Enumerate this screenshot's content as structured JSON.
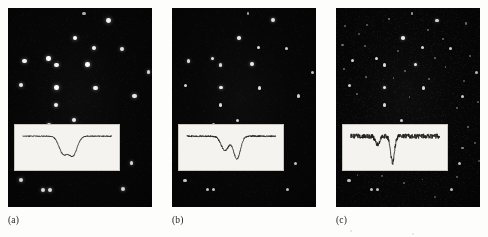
{
  "figure": {
    "background_color": "#fdfdfc",
    "panel_background_color": "#050505",
    "star_color": "#ffffff",
    "inset_background_color": "#f4f3ef",
    "inset_trace_color": "#1a1a1a",
    "caption_color": "#1b1b1b"
  },
  "panels": [
    {
      "id": "panel-a",
      "caption": "(a)",
      "field": {
        "x": 8,
        "y": 8,
        "width": 144,
        "height": 199
      },
      "caption_pos": {
        "x": 8,
        "y": 216
      },
      "depth_note": "bright star field, shallow limiting magnitude",
      "star_count": 22,
      "stars": [
        {
          "x": 0.7,
          "y": 0.062,
          "r": 2.4,
          "b": 1.0
        },
        {
          "x": 0.465,
          "y": 0.15,
          "r": 2.3,
          "b": 1.0
        },
        {
          "x": 0.6,
          "y": 0.2,
          "r": 2.0,
          "b": 0.95
        },
        {
          "x": 0.795,
          "y": 0.205,
          "r": 2.0,
          "b": 0.92
        },
        {
          "x": 0.115,
          "y": 0.265,
          "r": 2.2,
          "b": 0.98
        },
        {
          "x": 0.282,
          "y": 0.253,
          "r": 2.2,
          "b": 0.98
        },
        {
          "x": 0.336,
          "y": 0.287,
          "r": 2.2,
          "b": 0.96
        },
        {
          "x": 0.553,
          "y": 0.283,
          "r": 2.3,
          "b": 1.0
        },
        {
          "x": 0.975,
          "y": 0.323,
          "r": 1.9,
          "b": 0.9
        },
        {
          "x": 0.093,
          "y": 0.388,
          "r": 2.1,
          "b": 0.95
        },
        {
          "x": 0.338,
          "y": 0.4,
          "r": 2.3,
          "b": 1.0
        },
        {
          "x": 0.608,
          "y": 0.402,
          "r": 2.1,
          "b": 0.95
        },
        {
          "x": 0.878,
          "y": 0.443,
          "r": 2.1,
          "b": 0.94
        },
        {
          "x": 0.335,
          "y": 0.487,
          "r": 2.1,
          "b": 0.95
        },
        {
          "x": 0.455,
          "y": 0.565,
          "r": 2.0,
          "b": 0.92
        },
        {
          "x": 0.288,
          "y": 0.588,
          "r": 2.0,
          "b": 0.92
        },
        {
          "x": 0.858,
          "y": 0.78,
          "r": 1.9,
          "b": 0.9
        },
        {
          "x": 0.09,
          "y": 0.866,
          "r": 2.1,
          "b": 0.95
        },
        {
          "x": 0.245,
          "y": 0.913,
          "r": 2.0,
          "b": 0.93
        },
        {
          "x": 0.29,
          "y": 0.913,
          "r": 2.0,
          "b": 0.93
        },
        {
          "x": 0.8,
          "y": 0.912,
          "r": 2.0,
          "b": 0.93
        },
        {
          "x": 0.528,
          "y": 0.028,
          "r": 1.6,
          "b": 0.7
        }
      ],
      "inset": {
        "x": 0.045,
        "y": 0.585,
        "width": 0.735,
        "height": 0.235,
        "baseline_level": 0.25,
        "noise_amplitude": 0.012,
        "dips": [
          {
            "center": 0.455,
            "depth": 0.62,
            "width": 0.055
          },
          {
            "center": 0.565,
            "depth": 0.68,
            "width": 0.055
          }
        ]
      }
    },
    {
      "id": "panel-b",
      "caption": "(b)",
      "field": {
        "x": 172,
        "y": 8,
        "width": 144,
        "height": 199
      },
      "caption_pos": {
        "x": 172,
        "y": 216
      },
      "depth_note": "same field, intermediate depth",
      "star_count": 22,
      "stars": [
        {
          "x": 0.7,
          "y": 0.062,
          "r": 1.9,
          "b": 0.92
        },
        {
          "x": 0.465,
          "y": 0.15,
          "r": 1.8,
          "b": 0.9
        },
        {
          "x": 0.6,
          "y": 0.2,
          "r": 1.7,
          "b": 0.86
        },
        {
          "x": 0.795,
          "y": 0.205,
          "r": 1.7,
          "b": 0.84
        },
        {
          "x": 0.115,
          "y": 0.265,
          "r": 1.8,
          "b": 0.88
        },
        {
          "x": 0.282,
          "y": 0.253,
          "r": 1.8,
          "b": 0.88
        },
        {
          "x": 0.336,
          "y": 0.287,
          "r": 1.8,
          "b": 0.86
        },
        {
          "x": 0.553,
          "y": 0.283,
          "r": 1.9,
          "b": 0.92
        },
        {
          "x": 0.975,
          "y": 0.323,
          "r": 1.6,
          "b": 0.82
        },
        {
          "x": 0.093,
          "y": 0.388,
          "r": 1.7,
          "b": 0.86
        },
        {
          "x": 0.338,
          "y": 0.4,
          "r": 1.9,
          "b": 0.92
        },
        {
          "x": 0.608,
          "y": 0.402,
          "r": 1.7,
          "b": 0.86
        },
        {
          "x": 0.878,
          "y": 0.443,
          "r": 1.7,
          "b": 0.84
        },
        {
          "x": 0.335,
          "y": 0.487,
          "r": 1.7,
          "b": 0.86
        },
        {
          "x": 0.455,
          "y": 0.565,
          "r": 1.6,
          "b": 0.82
        },
        {
          "x": 0.288,
          "y": 0.588,
          "r": 1.6,
          "b": 0.82
        },
        {
          "x": 0.858,
          "y": 0.78,
          "r": 1.6,
          "b": 0.82
        },
        {
          "x": 0.09,
          "y": 0.866,
          "r": 1.7,
          "b": 0.86
        },
        {
          "x": 0.245,
          "y": 0.913,
          "r": 1.7,
          "b": 0.84
        },
        {
          "x": 0.29,
          "y": 0.913,
          "r": 1.7,
          "b": 0.84
        },
        {
          "x": 0.8,
          "y": 0.912,
          "r": 1.7,
          "b": 0.84
        },
        {
          "x": 0.528,
          "y": 0.028,
          "r": 1.4,
          "b": 0.64
        }
      ],
      "inset": {
        "x": 0.045,
        "y": 0.585,
        "width": 0.735,
        "height": 0.235,
        "baseline_level": 0.25,
        "noise_amplitude": 0.018,
        "dips": [
          {
            "center": 0.43,
            "depth": 0.52,
            "width": 0.05
          },
          {
            "center": 0.565,
            "depth": 0.82,
            "width": 0.045
          }
        ]
      }
    },
    {
      "id": "panel-c",
      "caption": "(c)",
      "field": {
        "x": 336,
        "y": 8,
        "width": 144,
        "height": 199
      },
      "caption_pos": {
        "x": 336,
        "y": 216
      },
      "depth_note": "deepest exposure, many faint stars visible",
      "star_count": 56,
      "stars": [
        {
          "x": 0.7,
          "y": 0.062,
          "r": 1.8,
          "b": 0.88
        },
        {
          "x": 0.465,
          "y": 0.15,
          "r": 1.8,
          "b": 0.9
        },
        {
          "x": 0.6,
          "y": 0.2,
          "r": 1.6,
          "b": 0.84
        },
        {
          "x": 0.795,
          "y": 0.205,
          "r": 1.6,
          "b": 0.82
        },
        {
          "x": 0.115,
          "y": 0.265,
          "r": 1.7,
          "b": 0.86
        },
        {
          "x": 0.282,
          "y": 0.253,
          "r": 1.7,
          "b": 0.86
        },
        {
          "x": 0.336,
          "y": 0.287,
          "r": 1.7,
          "b": 0.84
        },
        {
          "x": 0.553,
          "y": 0.283,
          "r": 1.8,
          "b": 0.9
        },
        {
          "x": 0.975,
          "y": 0.323,
          "r": 1.5,
          "b": 0.8
        },
        {
          "x": 0.093,
          "y": 0.388,
          "r": 1.6,
          "b": 0.84
        },
        {
          "x": 0.338,
          "y": 0.4,
          "r": 1.8,
          "b": 0.9
        },
        {
          "x": 0.608,
          "y": 0.402,
          "r": 1.6,
          "b": 0.84
        },
        {
          "x": 0.878,
          "y": 0.443,
          "r": 1.6,
          "b": 0.82
        },
        {
          "x": 0.335,
          "y": 0.487,
          "r": 1.6,
          "b": 0.84
        },
        {
          "x": 0.455,
          "y": 0.565,
          "r": 1.5,
          "b": 0.8
        },
        {
          "x": 0.288,
          "y": 0.588,
          "r": 1.5,
          "b": 0.8
        },
        {
          "x": 0.858,
          "y": 0.78,
          "r": 1.5,
          "b": 0.8
        },
        {
          "x": 0.09,
          "y": 0.866,
          "r": 1.6,
          "b": 0.84
        },
        {
          "x": 0.245,
          "y": 0.913,
          "r": 1.5,
          "b": 0.82
        },
        {
          "x": 0.29,
          "y": 0.913,
          "r": 1.5,
          "b": 0.82
        },
        {
          "x": 0.8,
          "y": 0.912,
          "r": 1.5,
          "b": 0.82
        },
        {
          "x": 0.528,
          "y": 0.028,
          "r": 1.2,
          "b": 0.6
        },
        {
          "x": 0.06,
          "y": 0.09,
          "r": 1.0,
          "b": 0.42
        },
        {
          "x": 0.215,
          "y": 0.085,
          "r": 1.0,
          "b": 0.4
        },
        {
          "x": 0.37,
          "y": 0.055,
          "r": 1.1,
          "b": 0.48
        },
        {
          "x": 0.905,
          "y": 0.078,
          "r": 1.1,
          "b": 0.46
        },
        {
          "x": 0.16,
          "y": 0.13,
          "r": 0.9,
          "b": 0.36
        },
        {
          "x": 0.64,
          "y": 0.112,
          "r": 1.0,
          "b": 0.4
        },
        {
          "x": 0.745,
          "y": 0.155,
          "r": 1.0,
          "b": 0.42
        },
        {
          "x": 0.045,
          "y": 0.185,
          "r": 1.1,
          "b": 0.46
        },
        {
          "x": 0.2,
          "y": 0.192,
          "r": 1.0,
          "b": 0.4
        },
        {
          "x": 0.43,
          "y": 0.218,
          "r": 0.9,
          "b": 0.36
        },
        {
          "x": 0.93,
          "y": 0.24,
          "r": 1.0,
          "b": 0.42
        },
        {
          "x": 0.69,
          "y": 0.252,
          "r": 1.0,
          "b": 0.4
        },
        {
          "x": 0.055,
          "y": 0.305,
          "r": 1.1,
          "b": 0.46
        },
        {
          "x": 0.48,
          "y": 0.318,
          "r": 1.0,
          "b": 0.4
        },
        {
          "x": 0.76,
          "y": 0.298,
          "r": 0.9,
          "b": 0.36
        },
        {
          "x": 0.205,
          "y": 0.345,
          "r": 1.0,
          "b": 0.4
        },
        {
          "x": 0.4,
          "y": 0.352,
          "r": 0.9,
          "b": 0.34
        },
        {
          "x": 0.645,
          "y": 0.355,
          "r": 1.0,
          "b": 0.42
        },
        {
          "x": 0.89,
          "y": 0.365,
          "r": 0.9,
          "b": 0.36
        },
        {
          "x": 0.148,
          "y": 0.432,
          "r": 1.0,
          "b": 0.4
        },
        {
          "x": 0.51,
          "y": 0.448,
          "r": 0.9,
          "b": 0.36
        },
        {
          "x": 0.985,
          "y": 0.47,
          "r": 1.0,
          "b": 0.42
        },
        {
          "x": 0.84,
          "y": 0.505,
          "r": 1.0,
          "b": 0.4
        },
        {
          "x": 0.915,
          "y": 0.6,
          "r": 1.1,
          "b": 0.46
        },
        {
          "x": 0.962,
          "y": 0.68,
          "r": 1.0,
          "b": 0.42
        },
        {
          "x": 0.878,
          "y": 0.705,
          "r": 1.2,
          "b": 0.55
        },
        {
          "x": 0.995,
          "y": 0.77,
          "r": 0.9,
          "b": 0.36
        },
        {
          "x": 0.84,
          "y": 0.848,
          "r": 1.0,
          "b": 0.4
        },
        {
          "x": 0.06,
          "y": 0.805,
          "r": 1.0,
          "b": 0.4
        },
        {
          "x": 0.15,
          "y": 0.84,
          "r": 0.9,
          "b": 0.34
        },
        {
          "x": 0.32,
          "y": 0.845,
          "r": 0.9,
          "b": 0.34
        },
        {
          "x": 0.47,
          "y": 0.878,
          "r": 1.0,
          "b": 0.4
        },
        {
          "x": 0.6,
          "y": 0.862,
          "r": 0.9,
          "b": 0.36
        },
        {
          "x": 0.69,
          "y": 0.948,
          "r": 0.9,
          "b": 0.36
        }
      ],
      "inset": {
        "x": 0.045,
        "y": 0.585,
        "width": 0.735,
        "height": 0.235,
        "baseline_level": 0.25,
        "noise_amplitude": 0.055,
        "dips": [
          {
            "center": 0.3,
            "depth": 0.3,
            "width": 0.028
          },
          {
            "center": 0.47,
            "depth": 0.95,
            "width": 0.026
          }
        ]
      }
    }
  ],
  "chart_data": {
    "type": "line",
    "xlabel": "wavelength (arbitrary units)",
    "ylabel": "relative flux",
    "xlim": [
      0,
      1
    ],
    "ylim": [
      0,
      1
    ],
    "grid": false,
    "legend_position": "none",
    "series": [
      {
        "name": "(a) spectrum",
        "description": "flat continuum with two comparable absorption dips",
        "x": [
          0.0,
          0.1,
          0.2,
          0.3,
          0.38,
          0.42,
          0.455,
          0.49,
          0.52,
          0.535,
          0.565,
          0.6,
          0.64,
          0.72,
          0.82,
          0.92,
          1.0
        ],
        "y": [
          0.75,
          0.75,
          0.75,
          0.75,
          0.74,
          0.55,
          0.13,
          0.55,
          0.73,
          0.52,
          0.07,
          0.5,
          0.74,
          0.75,
          0.75,
          0.75,
          0.75
        ]
      },
      {
        "name": "(b) spectrum",
        "description": "slightly noisier continuum, first dip shallower, second dip deeper",
        "x": [
          0.0,
          0.1,
          0.2,
          0.28,
          0.34,
          0.39,
          0.43,
          0.47,
          0.51,
          0.54,
          0.565,
          0.59,
          0.63,
          0.72,
          0.82,
          0.92,
          1.0
        ],
        "y": [
          0.75,
          0.74,
          0.76,
          0.74,
          0.75,
          0.58,
          0.23,
          0.58,
          0.74,
          0.45,
          0.0,
          0.46,
          0.74,
          0.75,
          0.74,
          0.75,
          0.75
        ]
      },
      {
        "name": "(c) spectrum",
        "description": "noisy continuum, one weak dip and one very deep narrow dip",
        "x": [
          0.0,
          0.06,
          0.12,
          0.18,
          0.24,
          0.28,
          0.3,
          0.32,
          0.36,
          0.42,
          0.455,
          0.47,
          0.485,
          0.52,
          0.58,
          0.66,
          0.74,
          0.84,
          0.94,
          1.0
        ],
        "y": [
          0.76,
          0.73,
          0.77,
          0.72,
          0.76,
          0.66,
          0.45,
          0.66,
          0.75,
          0.72,
          0.4,
          -0.2,
          0.4,
          0.74,
          0.73,
          0.77,
          0.72,
          0.76,
          0.74,
          0.75
        ]
      }
    ]
  },
  "page_marks": [
    {
      "x": 0.845,
      "y": 0.985,
      "r": 1.0
    },
    {
      "x": 0.718,
      "y": 0.972,
      "r": 0.8
    }
  ]
}
